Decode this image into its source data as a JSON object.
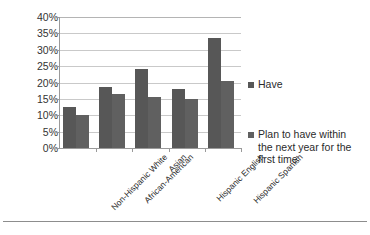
{
  "chart_data": {
    "type": "bar",
    "title": "",
    "xlabel": "",
    "ylabel": "",
    "ylim": [
      0,
      40
    ],
    "ytick_step": 5,
    "grid": true,
    "legend_position": "right",
    "value_suffix": "%",
    "categories": [
      "Non-Hispanic White",
      "African-American",
      "Asian",
      "Hispanic English",
      "Hispanic Spanish"
    ],
    "ytick_labels": [
      "40%",
      "35%",
      "30%",
      "25%",
      "20%",
      "15%",
      "10%",
      "5%",
      "0%"
    ],
    "series": [
      {
        "name": "Have",
        "color": "#575757",
        "values": [
          12.5,
          18.5,
          24.0,
          18.0,
          33.5
        ]
      },
      {
        "name": "Plan to have within the next year for the first time",
        "color": "#606060",
        "values": [
          10.0,
          16.5,
          15.5,
          15.0,
          20.5
        ]
      }
    ]
  },
  "legend": {
    "items": [
      {
        "label": "Have"
      },
      {
        "label": "Plan to have within the next year for the first time"
      }
    ]
  }
}
